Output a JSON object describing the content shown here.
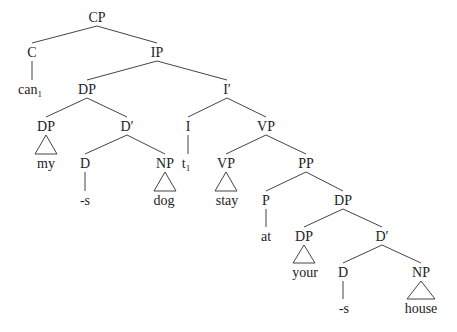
{
  "diagram": {
    "type": "syntax-tree",
    "nodes": [
      {
        "id": "cp",
        "label": "CP",
        "x": 97,
        "y": 22
      },
      {
        "id": "c",
        "label": "C",
        "x": 32,
        "y": 57
      },
      {
        "id": "ip",
        "label": "IP",
        "x": 157,
        "y": 57
      },
      {
        "id": "can",
        "label": "can",
        "sub": "1",
        "x": 30,
        "y": 94
      },
      {
        "id": "dp1",
        "label": "DP",
        "x": 87,
        "y": 94
      },
      {
        "id": "ibar",
        "label": "I′",
        "x": 227,
        "y": 94
      },
      {
        "id": "dp-my",
        "label": "DP",
        "x": 46,
        "y": 131
      },
      {
        "id": "dbar1",
        "label": "D′",
        "x": 127,
        "y": 131
      },
      {
        "id": "i",
        "label": "I",
        "x": 188,
        "y": 131
      },
      {
        "id": "vp1",
        "label": "VP",
        "x": 266,
        "y": 131
      },
      {
        "id": "my",
        "label": "my",
        "x": 46,
        "y": 168
      },
      {
        "id": "d1",
        "label": "D",
        "x": 85,
        "y": 168
      },
      {
        "id": "np-dog",
        "label": "NP",
        "x": 165,
        "y": 168
      },
      {
        "id": "t",
        "label": "t",
        "sub": "1",
        "x": 186,
        "y": 168
      },
      {
        "id": "vp-stay",
        "label": "VP",
        "x": 226,
        "y": 168
      },
      {
        "id": "pp",
        "label": "PP",
        "x": 306,
        "y": 168
      },
      {
        "id": "s1",
        "label": "-s",
        "x": 85,
        "y": 205
      },
      {
        "id": "dog",
        "label": "dog",
        "x": 164,
        "y": 205
      },
      {
        "id": "stay",
        "label": "stay",
        "x": 227,
        "y": 205
      },
      {
        "id": "p",
        "label": "P",
        "x": 266,
        "y": 205
      },
      {
        "id": "dp2",
        "label": "DP",
        "x": 343,
        "y": 205
      },
      {
        "id": "at",
        "label": "at",
        "x": 266,
        "y": 241
      },
      {
        "id": "dp-your",
        "label": "DP",
        "x": 304,
        "y": 241
      },
      {
        "id": "dbar2",
        "label": "D′",
        "x": 382,
        "y": 241
      },
      {
        "id": "your",
        "label": "your",
        "x": 305,
        "y": 277
      },
      {
        "id": "d2",
        "label": "D",
        "x": 343,
        "y": 277
      },
      {
        "id": "np-house",
        "label": "NP",
        "x": 421,
        "y": 277
      },
      {
        "id": "s2",
        "label": "-s",
        "x": 344,
        "y": 313
      },
      {
        "id": "house",
        "label": "house",
        "x": 421,
        "y": 313
      }
    ],
    "edges": [
      {
        "from": "cp",
        "to": "c"
      },
      {
        "from": "cp",
        "to": "ip"
      },
      {
        "from": "c",
        "to": "can",
        "style": "vertical"
      },
      {
        "from": "ip",
        "to": "dp1"
      },
      {
        "from": "ip",
        "to": "ibar"
      },
      {
        "from": "dp1",
        "to": "dp-my"
      },
      {
        "from": "dp1",
        "to": "dbar1"
      },
      {
        "from": "ibar",
        "to": "i"
      },
      {
        "from": "ibar",
        "to": "vp1"
      },
      {
        "from": "dp-my",
        "to": "my",
        "style": "triangle"
      },
      {
        "from": "dbar1",
        "to": "d1"
      },
      {
        "from": "dbar1",
        "to": "np-dog"
      },
      {
        "from": "i",
        "to": "t",
        "style": "vertical"
      },
      {
        "from": "vp1",
        "to": "vp-stay"
      },
      {
        "from": "vp1",
        "to": "pp"
      },
      {
        "from": "d1",
        "to": "s1",
        "style": "vertical"
      },
      {
        "from": "np-dog",
        "to": "dog",
        "style": "triangle"
      },
      {
        "from": "vp-stay",
        "to": "stay",
        "style": "triangle"
      },
      {
        "from": "pp",
        "to": "p"
      },
      {
        "from": "pp",
        "to": "dp2"
      },
      {
        "from": "p",
        "to": "at",
        "style": "vertical"
      },
      {
        "from": "dp2",
        "to": "dp-your"
      },
      {
        "from": "dp2",
        "to": "dbar2"
      },
      {
        "from": "dp-your",
        "to": "your",
        "style": "triangle"
      },
      {
        "from": "dbar2",
        "to": "d2"
      },
      {
        "from": "dbar2",
        "to": "np-house"
      },
      {
        "from": "d2",
        "to": "s2",
        "style": "vertical"
      },
      {
        "from": "np-house",
        "to": "house",
        "style": "triangle"
      }
    ]
  }
}
